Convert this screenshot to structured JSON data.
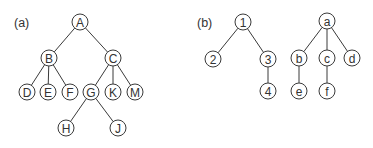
{
  "style": {
    "stroke": "#3a3a3a",
    "text": "#333333",
    "background": "#ffffff",
    "node_radius": 8
  },
  "panels": [
    {
      "id": "a",
      "label": "(a)",
      "label_pos": [
        14,
        27
      ],
      "nodes": [
        {
          "id": "A",
          "label": "A",
          "x": 80,
          "y": 22
        },
        {
          "id": "B",
          "label": "B",
          "x": 49,
          "y": 58
        },
        {
          "id": "C",
          "label": "C",
          "x": 113,
          "y": 58
        },
        {
          "id": "D",
          "label": "D",
          "x": 27,
          "y": 92
        },
        {
          "id": "E",
          "label": "E",
          "x": 48,
          "y": 92
        },
        {
          "id": "F",
          "label": "F",
          "x": 70,
          "y": 92
        },
        {
          "id": "G",
          "label": "G",
          "x": 91,
          "y": 92
        },
        {
          "id": "K",
          "label": "K",
          "x": 113,
          "y": 92
        },
        {
          "id": "M",
          "label": "M",
          "x": 135,
          "y": 92
        },
        {
          "id": "H",
          "label": "H",
          "x": 66,
          "y": 128
        },
        {
          "id": "J",
          "label": "J",
          "x": 118,
          "y": 128
        }
      ],
      "edges": [
        [
          "A",
          "B"
        ],
        [
          "A",
          "C"
        ],
        [
          "B",
          "D"
        ],
        [
          "B",
          "E"
        ],
        [
          "B",
          "F"
        ],
        [
          "C",
          "G"
        ],
        [
          "C",
          "K"
        ],
        [
          "C",
          "M"
        ],
        [
          "G",
          "H"
        ],
        [
          "G",
          "J"
        ]
      ]
    },
    {
      "id": "b",
      "label": "(b)",
      "label_pos": [
        197,
        27
      ],
      "nodes": [
        {
          "id": "n1",
          "label": "1",
          "x": 243,
          "y": 22
        },
        {
          "id": "n2",
          "label": "2",
          "x": 213,
          "y": 59
        },
        {
          "id": "n3",
          "label": "3",
          "x": 268,
          "y": 59
        },
        {
          "id": "n4",
          "label": "4",
          "x": 268,
          "y": 91
        },
        {
          "id": "a",
          "label": "a",
          "x": 327,
          "y": 21
        },
        {
          "id": "b",
          "label": "b",
          "x": 299,
          "y": 58
        },
        {
          "id": "c",
          "label": "c",
          "x": 327,
          "y": 58
        },
        {
          "id": "d",
          "label": "d",
          "x": 352,
          "y": 58
        },
        {
          "id": "e",
          "label": "e",
          "x": 299,
          "y": 91
        },
        {
          "id": "f",
          "label": "f",
          "x": 327,
          "y": 91
        }
      ],
      "edges": [
        [
          "n1",
          "n2"
        ],
        [
          "n1",
          "n3"
        ],
        [
          "n3",
          "n4"
        ],
        [
          "a",
          "b"
        ],
        [
          "a",
          "c"
        ],
        [
          "a",
          "d"
        ],
        [
          "b",
          "e"
        ],
        [
          "c",
          "f"
        ]
      ]
    }
  ]
}
